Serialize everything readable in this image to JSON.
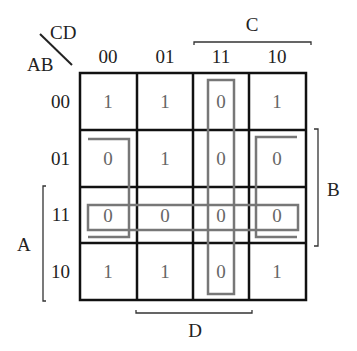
{
  "kmap": {
    "row_var_label": "AB",
    "col_var_label": "CD",
    "col_headers": [
      "00",
      "01",
      "11",
      "10"
    ],
    "row_headers": [
      "00",
      "01",
      "11",
      "10"
    ],
    "cells": [
      [
        "1",
        "1",
        "0",
        "1"
      ],
      [
        "0",
        "1",
        "0",
        "0"
      ],
      [
        "0",
        "0",
        "0",
        "0"
      ],
      [
        "1",
        "1",
        "0",
        "1"
      ]
    ],
    "bracket_labels": {
      "top": "C",
      "right": "B",
      "left": "A",
      "bottom": "D"
    },
    "groupings": [
      {
        "name": "column-11-group",
        "cells": "CD=11 all rows"
      },
      {
        "name": "row-11-group",
        "cells": "AB=11 all columns"
      },
      {
        "name": "corner-wrap-group",
        "cells": "AB=01,11 x CD=00,10"
      }
    ],
    "colors": {
      "grid": "#111111",
      "group_outline": "#777777",
      "value_text": "#666666",
      "label_text": "#222222"
    }
  }
}
